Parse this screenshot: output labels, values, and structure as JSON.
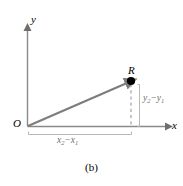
{
  "figure": {
    "caption": "(b)",
    "axes": {
      "x_label": "x",
      "y_label": "y",
      "origin_label": "O"
    },
    "point": {
      "label": "R",
      "marker": "filled-dot"
    },
    "vector": {
      "name": "displacement-vector",
      "from": "O",
      "to": "R",
      "style": "solid-arrow",
      "color": "#808080"
    },
    "components": {
      "horizontal": {
        "var": "x",
        "sub_end": "2",
        "minus": "−",
        "sub_start": "1"
      },
      "vertical": {
        "var": "y",
        "sub_end": "2",
        "minus": "−",
        "sub_start": "1"
      }
    },
    "colors": {
      "axis": "#8a8a8a",
      "vector": "#7d7d7d",
      "dashed": "#9a9a9a",
      "bracket": "#a8a8a8",
      "text": "#000000",
      "component_text": "#6f6f6f",
      "background": "#ffffff"
    }
  }
}
